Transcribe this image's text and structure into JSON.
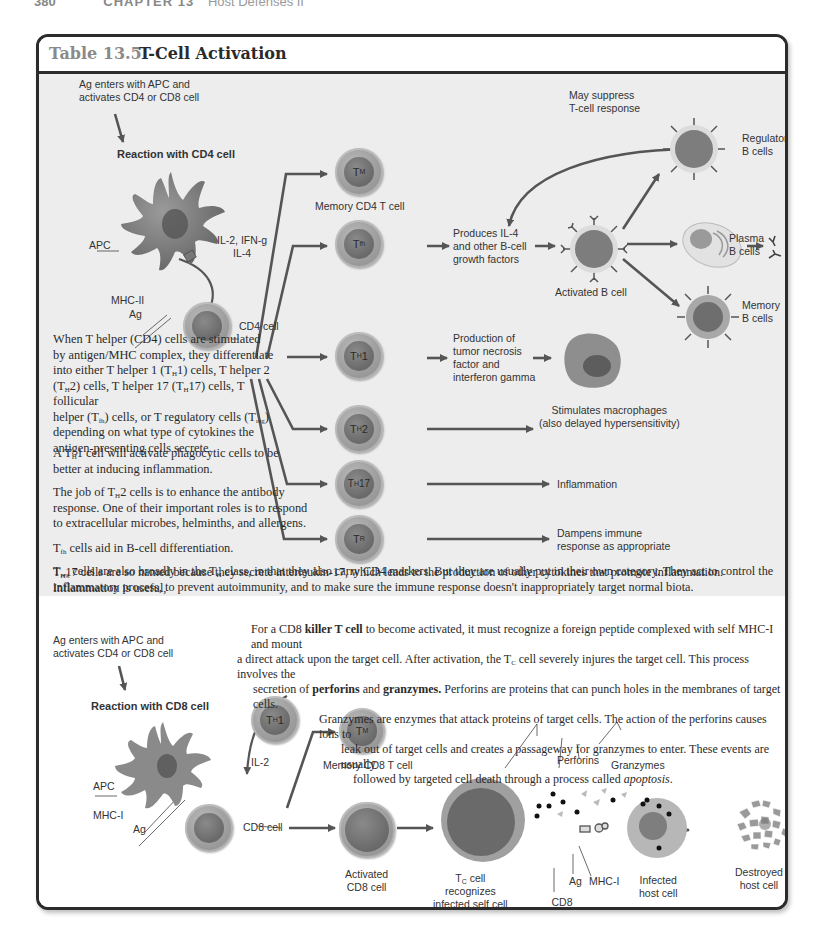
{
  "page_header": {
    "page_number": "380",
    "chapter": "CHAPTER 13",
    "chapter_title": "Host Defenses II"
  },
  "table": {
    "number": "Table 13.5",
    "title": "T-Cell Activation"
  },
  "cd4_section": {
    "intro_label": [
      "Ag enters with APC and",
      "activates CD4 or CD8 cell"
    ],
    "heading": "Reaction with CD4 cell",
    "apc_label": "APC",
    "cytokines_label": [
      "IL-2, IFN-g",
      "IL-4"
    ],
    "mhc_label": "MHC-II",
    "ag_label": "Ag",
    "cd4_cell_label": "CD4 cell",
    "cells": [
      {
        "symbol": "T",
        "sub": "M",
        "caption": "Memory CD4 T cell"
      },
      {
        "symbol": "T",
        "sub": "fh",
        "caption": ""
      },
      {
        "symbol": "T",
        "sub": "H",
        "suffix": "1",
        "caption": ""
      },
      {
        "symbol": "T",
        "sub": "H",
        "suffix": "2",
        "caption": ""
      },
      {
        "symbol": "T",
        "sub": "H",
        "suffix": "17",
        "caption": ""
      },
      {
        "symbol": "T",
        "sub": "R",
        "caption": ""
      }
    ],
    "tfh_effect": [
      "Produces IL-4",
      "and other B-cell",
      "growth factors"
    ],
    "activated_b_cell": "Activated B cell",
    "suppress_label": [
      "May suppress",
      "T-cell response"
    ],
    "b_cell_outcomes": [
      {
        "label": [
          "Regulatory",
          "B cells"
        ]
      },
      {
        "label": [
          "Plasma",
          "B cells"
        ]
      },
      {
        "label": [
          "Memory",
          "B cells"
        ]
      }
    ],
    "th1_effect": [
      "Production of",
      "tumor necrosis",
      "factor and",
      "interferon gamma"
    ],
    "macrophage_label": [
      "Stimulates macrophages",
      "(also delayed hypersensitivity)"
    ],
    "th17_effect": "Inflammation",
    "treg_effect": [
      "Dampens immune",
      "response as appropriate"
    ],
    "paragraphs": {
      "p1": [
        "When T helper (CD4) cells are stimulated",
        "by antigen/MHC complex, they differentiate",
        "into either T helper 1 (T",
        "1) cells, T helper 2",
        "(T",
        "2) cells, T helper 17 (T",
        "17) cells, T follicular",
        "helper (T",
        ") cells, or T regulatory cells (T",
        ")",
        "depending on what type of cytokines the",
        "antigen-presenting cells secrete."
      ],
      "p2": [
        "A T",
        "1 cell will activate phagocytic cells to be",
        "better at inducing inflammation."
      ],
      "p3": [
        "The job of T",
        "2 cells is to enhance the antibody",
        "response. One of their important roles is to respond",
        "to extracellular microbes, helminths, and allergens."
      ],
      "p4": [
        " cells aid in B-cell differentiation."
      ],
      "p5": [
        "17 cells are so named because they secrete interleukin-17, which leads to the production of other cytokines that promote inflammation. Inflammation is useful,",
        "of course, but when excessive or inappropriate may lead to inflammatory diseases such as Crohn's disease or psoriasis. T",
        "17 may be critical to these conditions."
      ],
      "p6": [
        " cells are also broadly in the T",
        " class, in that they also carry CD4 markers. But they are usually put in their own category. They act to control the",
        "inflammatory process, to prevent autoimmunity, and to make sure the immune response doesn't inappropriately target normal biota."
      ],
      "subs": {
        "H": "H",
        "fh": "fh",
        "reg": "reg"
      }
    }
  },
  "cd8_section": {
    "intro_label": [
      "Ag enters with APC and",
      "activates CD4 or CD8 cell"
    ],
    "heading": "Reaction with CD8 cell",
    "apc_label": "APC",
    "il2_label": "IL-2",
    "mhc_label": "MHC-I",
    "ag_label": "Ag",
    "cd8_cell_label": "CD8 cell",
    "th1_cell": {
      "symbol": "T",
      "sub": "H",
      "suffix": "1"
    },
    "memory_cell": {
      "symbol": "T",
      "sub": "M",
      "caption": "Memory CD8 T cell"
    },
    "activated_label": [
      "Activated",
      "CD8 cell"
    ],
    "tc_label": [
      "T",
      "C",
      " cell",
      "recognizes",
      "infected self cell"
    ],
    "cd8_molecule_label": [
      "CD8",
      "molecule"
    ],
    "ag_label2": "Ag",
    "mhc_label2": "MHC-I",
    "perforins_label": "Perforins",
    "granzymes_label": "Granzymes",
    "infected_label": [
      "Infected",
      "host cell"
    ],
    "destroyed_label": [
      "Destroyed",
      "host cell"
    ],
    "paragraph": {
      "l1a": "For a CD8 ",
      "l1b": "killer T cell",
      "l1c": " to become activated, it must recognize a foreign peptide complexed with self MHC-I and mount",
      "l2a": "a direct attack upon the target cell. After activation, the T",
      "l2sub": "C",
      "l2b": " cell severely injures the target cell. This process involves the",
      "l3a": "secretion of ",
      "l3b": "perforins",
      "l3c": " and ",
      "l3d": "granzymes.",
      "l3e": " Perforins are proteins that can punch holes in the membranes of target cells.",
      "l4": "Granzymes are enzymes that attack proteins of target cells. The action of the perforins causes ions to",
      "l5": "leak out of target cells and creates a passageway for granzymes to enter. These events are usually",
      "l6a": "followed by targeted cell death through a process called ",
      "l6b": "apoptosis",
      "l6c": "."
    }
  },
  "colors": {
    "frame": "#2b2b2b",
    "top_bg": "#ededed",
    "bottom_bg": "#ffffff",
    "arrow": "#555555",
    "title_num": "#8a8a8a"
  }
}
